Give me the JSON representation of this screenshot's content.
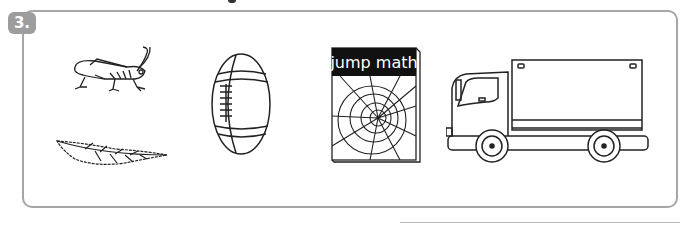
{
  "exercise": {
    "number": "3.",
    "badge_color": "#9d9d9d",
    "border_color": "#a6a6a6"
  },
  "pictures": [
    {
      "name": "grasshopper",
      "label": ""
    },
    {
      "name": "leaf",
      "label": ""
    },
    {
      "name": "football",
      "label": ""
    },
    {
      "name": "book",
      "label": "jump math"
    },
    {
      "name": "truck",
      "label": ""
    }
  ]
}
